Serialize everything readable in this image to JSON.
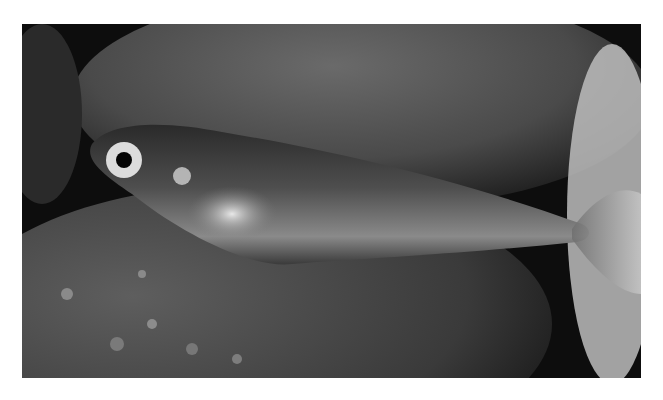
{
  "image": {
    "alt": "Photograph of a small translucent fish with a large eye resting on dark rocks",
    "subject": "fish",
    "tone": "grayscale"
  }
}
